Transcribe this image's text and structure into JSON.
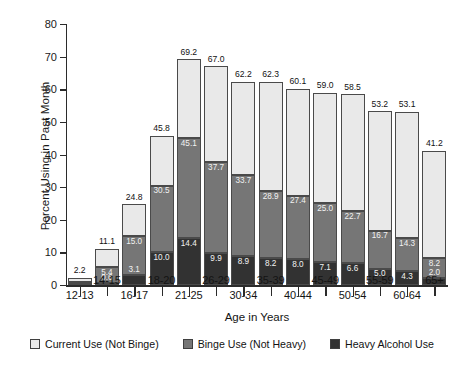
{
  "chart_data": {
    "type": "bar",
    "stacked": true,
    "title": "",
    "xlabel": "Age in Years",
    "ylabel": "Percent Using in Past Month",
    "ylim": [
      0,
      80
    ],
    "yticks": [
      0,
      10,
      20,
      30,
      40,
      50,
      60,
      70,
      80
    ],
    "grid": false,
    "legend_position": "bottom",
    "categories": [
      "12-13",
      "14-15",
      "16-17",
      "18-20",
      "21-25",
      "26-29",
      "30-34",
      "35-39",
      "40-44",
      "45-49",
      "50-54",
      "55-59",
      "60-64",
      "65+"
    ],
    "series": [
      {
        "name": "Heavy Alcohol Use",
        "color": "#323232",
        "values": [
          0.2,
          0.6,
          3.1,
          10.0,
          14.4,
          9.9,
          8.9,
          8.2,
          8.0,
          7.1,
          6.6,
          5.0,
          4.3,
          2.0
        ]
      },
      {
        "name": "Binge Use (Not Heavy)",
        "color": "#767676",
        "values": [
          0.4,
          4.8,
          11.9,
          20.5,
          30.7,
          27.8,
          24.8,
          20.7,
          19.4,
          17.9,
          16.1,
          11.7,
          10.0,
          6.2
        ]
      },
      {
        "name": "Current Use (Not Binge)",
        "color": "#e9e9e9",
        "values": [
          1.6,
          5.7,
          9.8,
          15.3,
          24.1,
          29.3,
          28.5,
          33.4,
          32.7,
          35.1,
          35.8,
          36.5,
          38.8,
          33.0
        ]
      }
    ],
    "cumulative_labels": {
      "heavy": [
        "",
        "0.6",
        "3.1",
        "10.0",
        "14.4",
        "9.9",
        "8.9",
        "8.2",
        "8.0",
        "7.1",
        "6.6",
        "5.0",
        "4.3",
        "2.0"
      ],
      "binge_top": [
        "",
        "5.4",
        "15.0",
        "30.5",
        "45.1",
        "37.7",
        "33.7",
        "28.9",
        "27.4",
        "25.0",
        "22.7",
        "16.7",
        "14.3",
        "8.2"
      ],
      "total": [
        "2.2",
        "11.1",
        "24.8",
        "45.8",
        "69.2",
        "67.0",
        "62.2",
        "62.3",
        "60.1",
        "59.0",
        "58.5",
        "53.2",
        "53.1",
        "41.2"
      ]
    },
    "bars": [
      {
        "category": "12-13",
        "heavy": 0.2,
        "binge_top": 0.9,
        "total": 2.2,
        "heavy_label": "",
        "binge_label": "",
        "total_label": "2.2",
        "binge_label_dark": false
      },
      {
        "category": "14-15",
        "heavy": 0.6,
        "binge_top": 5.4,
        "total": 11.1,
        "heavy_label": "0.6",
        "binge_label": "5.4",
        "total_label": "11.1",
        "binge_label_dark": false
      },
      {
        "category": "16-17",
        "heavy": 3.1,
        "binge_top": 15.0,
        "total": 24.8,
        "heavy_label": "3.1",
        "binge_label": "15.0",
        "total_label": "24.8",
        "binge_label_dark": false
      },
      {
        "category": "18-20",
        "heavy": 10.0,
        "binge_top": 30.5,
        "total": 45.8,
        "heavy_label": "10.0",
        "binge_label": "30.5",
        "total_label": "45.8",
        "binge_label_dark": false
      },
      {
        "category": "21-25",
        "heavy": 14.4,
        "binge_top": 45.1,
        "total": 69.2,
        "heavy_label": "14.4",
        "binge_label": "45.1",
        "total_label": "69.2",
        "binge_label_dark": false
      },
      {
        "category": "26-29",
        "heavy": 9.9,
        "binge_top": 37.7,
        "total": 67.0,
        "heavy_label": "9.9",
        "binge_label": "37.7",
        "total_label": "67.0",
        "binge_label_dark": false
      },
      {
        "category": "30-34",
        "heavy": 8.9,
        "binge_top": 33.7,
        "total": 62.2,
        "heavy_label": "8.9",
        "binge_label": "33.7",
        "total_label": "62.2",
        "binge_label_dark": false
      },
      {
        "category": "35-39",
        "heavy": 8.2,
        "binge_top": 28.9,
        "total": 62.3,
        "heavy_label": "8.2",
        "binge_label": "28.9",
        "total_label": "62.3",
        "binge_label_dark": false
      },
      {
        "category": "40-44",
        "heavy": 8.0,
        "binge_top": 27.4,
        "total": 60.1,
        "heavy_label": "8.0",
        "binge_label": "27.4",
        "total_label": "60.1",
        "binge_label_dark": false
      },
      {
        "category": "45-49",
        "heavy": 7.1,
        "binge_top": 25.0,
        "total": 59.0,
        "heavy_label": "7.1",
        "binge_label": "25.0",
        "total_label": "59.0",
        "binge_label_dark": false
      },
      {
        "category": "50-54",
        "heavy": 6.6,
        "binge_top": 22.7,
        "total": 58.5,
        "heavy_label": "6.6",
        "binge_label": "22.7",
        "total_label": "58.5",
        "binge_label_dark": false
      },
      {
        "category": "55-59",
        "heavy": 5.0,
        "binge_top": 16.7,
        "total": 53.2,
        "heavy_label": "5.0",
        "binge_label": "16.7",
        "total_label": "53.2",
        "binge_label_dark": false
      },
      {
        "category": "60-64",
        "heavy": 4.3,
        "binge_top": 14.3,
        "total": 53.1,
        "heavy_label": "4.3",
        "binge_label": "14.3",
        "total_label": "53.1",
        "binge_label_dark": false
      },
      {
        "category": "65+",
        "heavy": 2.0,
        "binge_top": 8.2,
        "total": 41.2,
        "heavy_label": "2.0",
        "binge_label": "8.2",
        "total_label": "41.2",
        "binge_label_dark": false
      }
    ]
  },
  "legend": {
    "items": [
      {
        "label": "Current Use (Not Binge)",
        "color": "#e9e9e9"
      },
      {
        "label": "Binge Use (Not Heavy)",
        "color": "#767676"
      },
      {
        "label": "Heavy Alcohol Use",
        "color": "#323232"
      }
    ]
  }
}
